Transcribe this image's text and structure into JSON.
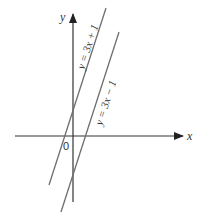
{
  "diagram": {
    "type": "coordinate-graph",
    "axes": {
      "x_label": "x",
      "y_label": "y",
      "origin_label": "0"
    },
    "lines": [
      {
        "equation": "y = 3x + 1",
        "slope": 3,
        "intercept": 1
      },
      {
        "equation": "y = 3x − 1",
        "slope": 3,
        "intercept": -1
      }
    ],
    "colors": {
      "line": "#6e6e6e",
      "axis": "#333333",
      "text": "#333333"
    }
  }
}
